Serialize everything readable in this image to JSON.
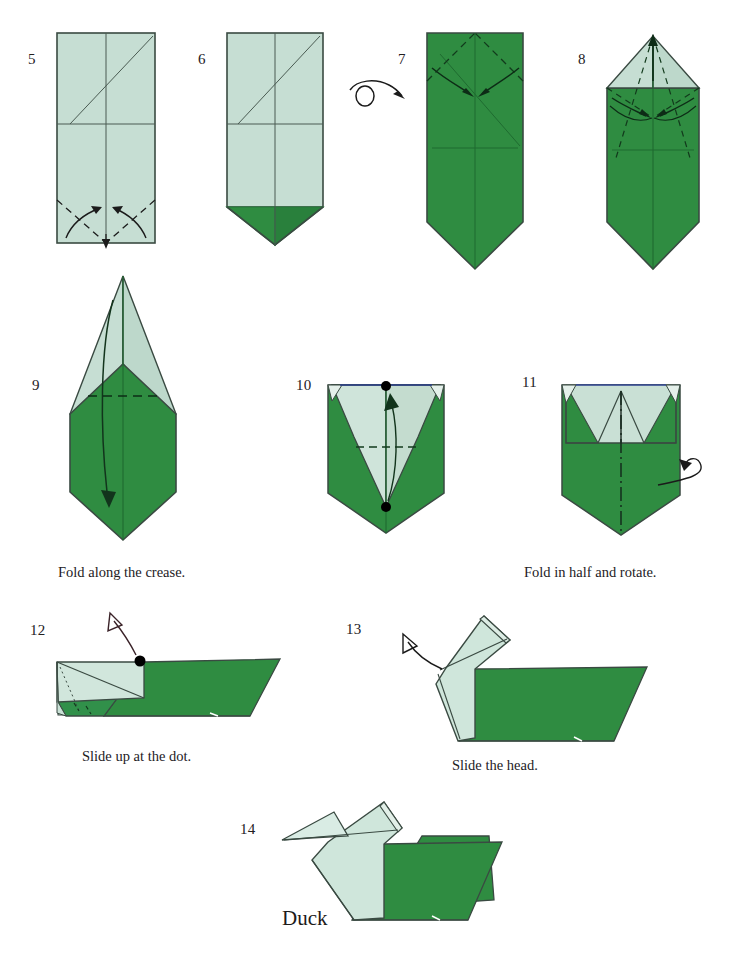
{
  "document": {
    "type": "origami-diagram",
    "model_name": "Duck",
    "background_color": "#ffffff"
  },
  "colors": {
    "paper_front_dark_green": "#2f8c41",
    "paper_front_dark_green_shade": "#26793a",
    "paper_back_light_green": "#c6ded3",
    "paper_back_light_green_shade": "#b4d3c6",
    "paper_back_light_green_pale": "#d9ebe2",
    "outline": "#3a4a42",
    "crease_line": "#3a4a42",
    "arrow": "#1b1b1b",
    "text": "#23201e",
    "dot": "#000000",
    "edge_blue": "#2b3f8c"
  },
  "steps": [
    {
      "number": "5",
      "number_pos": {
        "x": 28,
        "y": 52
      },
      "caption": "",
      "description": "Rectangle, white side up, with center creases and diagonal; valley-fold the two lower corners to the center line."
    },
    {
      "number": "6",
      "number_pos": {
        "x": 198,
        "y": 52
      },
      "caption": "",
      "description": "Result: a green point formed at the bottom. Turn the model over."
    },
    {
      "number": "7",
      "number_pos": {
        "x": 398,
        "y": 52
      },
      "caption": "",
      "description": "Green side up; fold the two upper corners in to the center."
    },
    {
      "number": "8",
      "number_pos": {
        "x": 578,
        "y": 52
      },
      "caption": "",
      "description": "Light point at top; fold the upper edges to the center line."
    },
    {
      "number": "9",
      "number_pos": {
        "x": 32,
        "y": 378
      },
      "caption": "Fold along the crease.",
      "caption_pos": {
        "x": 58,
        "y": 565
      },
      "description": "Tall pointed kite shape; fold the top point down along the horizontal crease."
    },
    {
      "number": "10",
      "number_pos": {
        "x": 296,
        "y": 378
      },
      "caption": "",
      "description": "Two dots on the center line; fold the bottom point up to the top dot."
    },
    {
      "number": "11",
      "number_pos": {
        "x": 522,
        "y": 375
      },
      "caption": "Fold in half and rotate.",
      "caption_pos": {
        "x": 524,
        "y": 565
      },
      "description": "Mountain-fold in half along the vertical center line and rotate."
    },
    {
      "number": "12",
      "number_pos": {
        "x": 30,
        "y": 623
      },
      "caption": "Slide up at the dot.",
      "caption_pos": {
        "x": 82,
        "y": 749
      },
      "description": "Side view of the folded body; slide the neck flap upward at the dot."
    },
    {
      "number": "13",
      "number_pos": {
        "x": 346,
        "y": 622
      },
      "caption": "Slide the head.",
      "caption_pos": {
        "x": 452,
        "y": 758
      },
      "description": "Neck raised; slide the head up to form the beak."
    },
    {
      "number": "14",
      "number_pos": {
        "x": 240,
        "y": 822
      },
      "caption": "",
      "description": "Completed duck."
    }
  ],
  "symbols": [
    {
      "name": "turn-over-icon",
      "meaning": "Turn the model over",
      "pos": {
        "x": 348,
        "y": 72
      }
    },
    {
      "name": "rotate-behind-icon",
      "meaning": "Fold behind / rotate",
      "pos": {
        "x": 660,
        "y": 445
      }
    }
  ],
  "final_title": {
    "text": "Duck",
    "pos": {
      "x": 282,
      "y": 915
    }
  },
  "legend": {
    "valley_fold": "dashed line",
    "mountain_fold": "dash-dot line",
    "hidden_edge": "dotted line",
    "fold_arrow": "solid curved arrow with solid head",
    "dot_marker": "filled black circle reference point"
  }
}
